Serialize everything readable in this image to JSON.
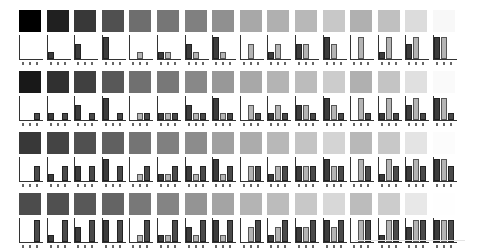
{
  "chart_data": {
    "type": "bar",
    "title": "",
    "bar_labels": [
      "R",
      "G",
      "B"
    ],
    "levels": [
      0,
      0.333,
      0.667,
      1
    ],
    "ylim": [
      0,
      1
    ],
    "grid": false,
    "rows": [
      {
        "c": 0,
        "cells": [
          {
            "a": 0,
            "b": 0,
            "c": 0,
            "gray": "#000000"
          },
          {
            "a": 1,
            "b": 0,
            "c": 0,
            "gray": "#202020"
          },
          {
            "a": 2,
            "b": 0,
            "c": 0,
            "gray": "#383838"
          },
          {
            "a": 3,
            "b": 0,
            "c": 0,
            "gray": "#505050"
          },
          {
            "a": 0,
            "b": 1,
            "c": 0,
            "gray": "#6e6e6e"
          },
          {
            "a": 1,
            "b": 1,
            "c": 0,
            "gray": "#767676"
          },
          {
            "a": 2,
            "b": 1,
            "c": 0,
            "gray": "#808080"
          },
          {
            "a": 3,
            "b": 1,
            "c": 0,
            "gray": "#909090"
          },
          {
            "a": 0,
            "b": 2,
            "c": 0,
            "gray": "#a8a8a8"
          },
          {
            "a": 1,
            "b": 2,
            "c": 0,
            "gray": "#b0b0b0"
          },
          {
            "a": 2,
            "b": 2,
            "c": 0,
            "gray": "#b8b8b8"
          },
          {
            "a": 3,
            "b": 2,
            "c": 0,
            "gray": "#c8c8c8"
          },
          {
            "a": 0,
            "b": 3,
            "c": 0,
            "gray": "#b0b0b0"
          },
          {
            "a": 1,
            "b": 3,
            "c": 0,
            "gray": "#c0c0c0"
          },
          {
            "a": 2,
            "b": 3,
            "c": 0,
            "gray": "#dcdcdc"
          },
          {
            "a": 3,
            "b": 3,
            "c": 0,
            "gray": "#f8f8f8"
          }
        ]
      },
      {
        "c": 1,
        "cells": [
          {
            "a": 0,
            "b": 0,
            "c": 1,
            "gray": "#181818"
          },
          {
            "a": 1,
            "b": 0,
            "c": 1,
            "gray": "#303030"
          },
          {
            "a": 2,
            "b": 0,
            "c": 1,
            "gray": "#404040"
          },
          {
            "a": 3,
            "b": 0,
            "c": 1,
            "gray": "#585858"
          },
          {
            "a": 0,
            "b": 1,
            "c": 1,
            "gray": "#707070"
          },
          {
            "a": 1,
            "b": 1,
            "c": 1,
            "gray": "#787878"
          },
          {
            "a": 2,
            "b": 1,
            "c": 1,
            "gray": "#888888"
          },
          {
            "a": 3,
            "b": 1,
            "c": 1,
            "gray": "#989898"
          },
          {
            "a": 0,
            "b": 2,
            "c": 1,
            "gray": "#a8a8a8"
          },
          {
            "a": 1,
            "b": 2,
            "c": 1,
            "gray": "#b4b4b4"
          },
          {
            "a": 2,
            "b": 2,
            "c": 1,
            "gray": "#bcbcbc"
          },
          {
            "a": 3,
            "b": 2,
            "c": 1,
            "gray": "#cccccc"
          },
          {
            "a": 0,
            "b": 3,
            "c": 1,
            "gray": "#b0b0b0"
          },
          {
            "a": 1,
            "b": 3,
            "c": 1,
            "gray": "#c4c4c4"
          },
          {
            "a": 2,
            "b": 3,
            "c": 1,
            "gray": "#e0e0e0"
          },
          {
            "a": 3,
            "b": 3,
            "c": 1,
            "gray": "#fafafa"
          }
        ]
      },
      {
        "c": 2,
        "cells": [
          {
            "a": 0,
            "b": 0,
            "c": 2,
            "gray": "#383838"
          },
          {
            "a": 1,
            "b": 0,
            "c": 2,
            "gray": "#444444"
          },
          {
            "a": 2,
            "b": 0,
            "c": 2,
            "gray": "#505050"
          },
          {
            "a": 3,
            "b": 0,
            "c": 2,
            "gray": "#606060"
          },
          {
            "a": 0,
            "b": 1,
            "c": 2,
            "gray": "#747474"
          },
          {
            "a": 1,
            "b": 1,
            "c": 2,
            "gray": "#808080"
          },
          {
            "a": 2,
            "b": 1,
            "c": 2,
            "gray": "#8c8c8c"
          },
          {
            "a": 3,
            "b": 1,
            "c": 2,
            "gray": "#a0a0a0"
          },
          {
            "a": 0,
            "b": 2,
            "c": 2,
            "gray": "#acacac"
          },
          {
            "a": 1,
            "b": 2,
            "c": 2,
            "gray": "#b8b8b8"
          },
          {
            "a": 2,
            "b": 2,
            "c": 2,
            "gray": "#c4c4c4"
          },
          {
            "a": 3,
            "b": 2,
            "c": 2,
            "gray": "#d4d4d4"
          },
          {
            "a": 0,
            "b": 3,
            "c": 2,
            "gray": "#b8b8b8"
          },
          {
            "a": 1,
            "b": 3,
            "c": 2,
            "gray": "#c8c8c8"
          },
          {
            "a": 2,
            "b": 3,
            "c": 2,
            "gray": "#e4e4e4"
          },
          {
            "a": 3,
            "b": 3,
            "c": 2,
            "gray": "#fcfcfc"
          }
        ]
      },
      {
        "c": 3,
        "cells": [
          {
            "a": 0,
            "b": 0,
            "c": 3,
            "gray": "#4c4c4c"
          },
          {
            "a": 1,
            "b": 0,
            "c": 3,
            "gray": "#505050"
          },
          {
            "a": 2,
            "b": 0,
            "c": 3,
            "gray": "#585858"
          },
          {
            "a": 3,
            "b": 0,
            "c": 3,
            "gray": "#646464"
          },
          {
            "a": 0,
            "b": 1,
            "c": 3,
            "gray": "#787878"
          },
          {
            "a": 1,
            "b": 1,
            "c": 3,
            "gray": "#848484"
          },
          {
            "a": 2,
            "b": 1,
            "c": 3,
            "gray": "#949494"
          },
          {
            "a": 3,
            "b": 1,
            "c": 3,
            "gray": "#a4a4a4"
          },
          {
            "a": 0,
            "b": 2,
            "c": 3,
            "gray": "#b4b4b4"
          },
          {
            "a": 1,
            "b": 2,
            "c": 3,
            "gray": "#bcbcbc"
          },
          {
            "a": 2,
            "b": 2,
            "c": 3,
            "gray": "#c8c8c8"
          },
          {
            "a": 3,
            "b": 2,
            "c": 3,
            "gray": "#d8d8d8"
          },
          {
            "a": 0,
            "b": 3,
            "c": 3,
            "gray": "#bcbcbc"
          },
          {
            "a": 1,
            "b": 3,
            "c": 3,
            "gray": "#cccccc"
          },
          {
            "a": 2,
            "b": 3,
            "c": 3,
            "gray": "#e8e8e8"
          },
          {
            "a": 3,
            "b": 3,
            "c": 3,
            "gray": "#fefefe"
          }
        ]
      }
    ]
  },
  "layout": {
    "col_pitch": 27.6,
    "row_pitch": 61,
    "bar_max_height": 22
  }
}
